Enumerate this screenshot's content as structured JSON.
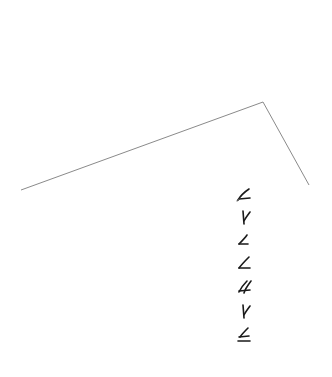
{
  "image": {
    "width": 332,
    "height": 377,
    "background": "#ffffff"
  },
  "outline": {
    "description": "thin gray polyline forming an open roof/angle shape",
    "color": "#8a8a8a",
    "points": [
      [
        21,
        190
      ],
      [
        263,
        102
      ],
      [
        309,
        185
      ]
    ]
  },
  "glyph_column": {
    "description": "vertical column of seven handwritten stroke glyphs",
    "color": "#1a1a1a",
    "center_x": 244,
    "glyphs": [
      {
        "index": 1,
        "shape": "angle-with-hook",
        "y": 195
      },
      {
        "index": 2,
        "shape": "y-fork",
        "y": 217
      },
      {
        "index": 3,
        "shape": "small-angle",
        "y": 240
      },
      {
        "index": 4,
        "shape": "angle",
        "y": 263
      },
      {
        "index": 5,
        "shape": "double-angle",
        "y": 287
      },
      {
        "index": 6,
        "shape": "y-fork",
        "y": 311
      },
      {
        "index": 7,
        "shape": "angle-with-underline",
        "y": 335
      }
    ]
  }
}
